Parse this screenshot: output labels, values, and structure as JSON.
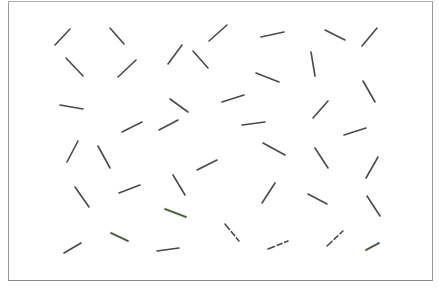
{
  "display": {
    "background": "#ffffff",
    "frame_color": "#9a9a9a",
    "segment_color": "#4a4a4a",
    "segment_width": 1.6,
    "tint_color": "#9be07a"
  },
  "segments": [
    {
      "x1": 55,
      "y1": 45,
      "x2": 70,
      "y2": 29
    },
    {
      "x1": 110,
      "y1": 28,
      "x2": 124,
      "y2": 44
    },
    {
      "x1": 168,
      "y1": 64,
      "x2": 182,
      "y2": 45
    },
    {
      "x1": 209,
      "y1": 41,
      "x2": 227,
      "y2": 25
    },
    {
      "x1": 261,
      "y1": 37,
      "x2": 284,
      "y2": 32
    },
    {
      "x1": 325,
      "y1": 30,
      "x2": 345,
      "y2": 40
    },
    {
      "x1": 362,
      "y1": 46,
      "x2": 377,
      "y2": 28
    },
    {
      "x1": 66,
      "y1": 58,
      "x2": 83,
      "y2": 76
    },
    {
      "x1": 118,
      "y1": 77,
      "x2": 136,
      "y2": 60
    },
    {
      "x1": 193,
      "y1": 51,
      "x2": 208,
      "y2": 68
    },
    {
      "x1": 256,
      "y1": 73,
      "x2": 279,
      "y2": 82
    },
    {
      "x1": 311,
      "y1": 52,
      "x2": 315,
      "y2": 76
    },
    {
      "x1": 60,
      "y1": 105,
      "x2": 83,
      "y2": 109
    },
    {
      "x1": 170,
      "y1": 99,
      "x2": 188,
      "y2": 112
    },
    {
      "x1": 222,
      "y1": 102,
      "x2": 244,
      "y2": 95
    },
    {
      "x1": 363,
      "y1": 81,
      "x2": 375,
      "y2": 102
    },
    {
      "x1": 313,
      "y1": 118,
      "x2": 328,
      "y2": 101
    },
    {
      "x1": 122,
      "y1": 132,
      "x2": 142,
      "y2": 122
    },
    {
      "x1": 159,
      "y1": 130,
      "x2": 178,
      "y2": 120
    },
    {
      "x1": 242,
      "y1": 125,
      "x2": 265,
      "y2": 122
    },
    {
      "x1": 344,
      "y1": 135,
      "x2": 366,
      "y2": 128
    },
    {
      "x1": 67,
      "y1": 162,
      "x2": 78,
      "y2": 141
    },
    {
      "x1": 98,
      "y1": 146,
      "x2": 110,
      "y2": 168
    },
    {
      "x1": 197,
      "y1": 170,
      "x2": 217,
      "y2": 160
    },
    {
      "x1": 263,
      "y1": 143,
      "x2": 285,
      "y2": 155
    },
    {
      "x1": 315,
      "y1": 148,
      "x2": 328,
      "y2": 168
    },
    {
      "x1": 366,
      "y1": 178,
      "x2": 378,
      "y2": 157
    },
    {
      "x1": 75,
      "y1": 187,
      "x2": 89,
      "y2": 207
    },
    {
      "x1": 119,
      "y1": 193,
      "x2": 140,
      "y2": 185
    },
    {
      "x1": 173,
      "y1": 175,
      "x2": 185,
      "y2": 195
    },
    {
      "x1": 262,
      "y1": 203,
      "x2": 275,
      "y2": 183
    },
    {
      "x1": 308,
      "y1": 194,
      "x2": 327,
      "y2": 204
    },
    {
      "x1": 367,
      "y1": 196,
      "x2": 380,
      "y2": 216
    },
    {
      "x1": 165,
      "y1": 209,
      "x2": 186,
      "y2": 217,
      "tint": true
    },
    {
      "x1": 64,
      "y1": 253,
      "x2": 81,
      "y2": 243
    },
    {
      "x1": 111,
      "y1": 233,
      "x2": 128,
      "y2": 241,
      "tint": true
    },
    {
      "x1": 157,
      "y1": 251,
      "x2": 179,
      "y2": 248
    },
    {
      "x1": 225,
      "y1": 224,
      "x2": 239,
      "y2": 241,
      "broken": true
    },
    {
      "x1": 268,
      "y1": 249,
      "x2": 288,
      "y2": 241,
      "broken": true
    },
    {
      "x1": 327,
      "y1": 246,
      "x2": 343,
      "y2": 231,
      "broken": true
    },
    {
      "x1": 366,
      "y1": 250,
      "x2": 379,
      "y2": 243,
      "tint": true
    }
  ]
}
